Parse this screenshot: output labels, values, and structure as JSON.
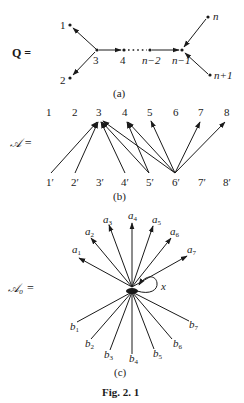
{
  "figure": {
    "caption": "Fig. 2. 1"
  },
  "panel_a": {
    "label": "Q =",
    "sublabel": "(a)",
    "vertices": {
      "v1": "1",
      "v2": "2",
      "v3": "3",
      "v4": "4",
      "vn2": "n−2",
      "vn1": "n−1",
      "vn": "n",
      "vn1p": "n+1"
    },
    "edges": [
      {
        "from": "3",
        "to": "1"
      },
      {
        "from": "3",
        "to": "2"
      },
      {
        "from": "3",
        "to": "4"
      },
      {
        "from": "4",
        "to": "n−2",
        "style": "dotted"
      },
      {
        "from": "n−2",
        "to": "n−1"
      },
      {
        "from": "n",
        "to": "n−1"
      },
      {
        "from": "n+1",
        "to": "n−1"
      }
    ]
  },
  "panel_b": {
    "label": "𝒜 =",
    "sublabel": "(b)",
    "top": [
      "1",
      "2",
      "3",
      "4",
      "5",
      "6",
      "7",
      "8"
    ],
    "bottom": [
      "1′",
      "2′",
      "3′",
      "4′",
      "5′",
      "6′",
      "7′",
      "8′"
    ],
    "edges": [
      {
        "from": "1′",
        "to": "3"
      },
      {
        "from": "2′",
        "to": "3"
      },
      {
        "from": "4′",
        "to": "3"
      },
      {
        "from": "5′",
        "to": "3"
      },
      {
        "from": "5′",
        "to": "4"
      },
      {
        "from": "6′",
        "to": "3"
      },
      {
        "from": "6′",
        "to": "4"
      },
      {
        "from": "6′",
        "to": "5"
      },
      {
        "from": "6′",
        "to": "7"
      },
      {
        "from": "6′",
        "to": "8"
      }
    ]
  },
  "panel_c": {
    "label": "𝒜₀ =",
    "sublabel": "(c)",
    "loop_label": "x",
    "out_labels": {
      "a1": "a",
      "a1s": "1",
      "a2": "a",
      "a2s": "2",
      "a3": "a",
      "a3s": "3",
      "a4": "a",
      "a4s": "4",
      "a5": "a",
      "a5s": "5",
      "a6": "a",
      "a6s": "6",
      "a7": "a",
      "a7s": "7"
    },
    "in_labels": {
      "b1": "b",
      "b1s": "1",
      "b2": "b",
      "b2s": "2",
      "b3": "b",
      "b3s": "3",
      "b4": "b",
      "b4s": "4",
      "b5": "b",
      "b5s": "5",
      "b6": "b",
      "b6s": "6",
      "b7": "b",
      "b7s": "7"
    }
  }
}
